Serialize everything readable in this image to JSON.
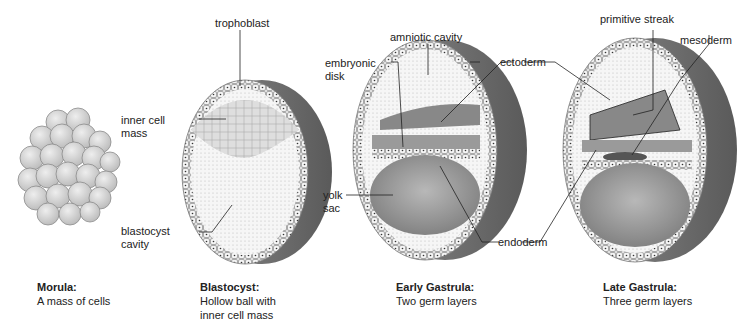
{
  "stages": [
    {
      "title": "Morula:",
      "desc": [
        "A mass of cells"
      ]
    },
    {
      "title": "Blastocyst:",
      "desc": [
        "Hollow ball with",
        "inner cell mass"
      ]
    },
    {
      "title": "Early Gastrula:",
      "desc": [
        "Two germ layers"
      ]
    },
    {
      "title": "Late Gastrula:",
      "desc": [
        "Three germ layers"
      ]
    }
  ],
  "labels": {
    "trophoblast": "trophoblast",
    "inner_cell_mass": [
      "inner cell",
      "mass"
    ],
    "blastocyst_cavity": [
      "blastocyst",
      "cavity"
    ],
    "amniotic_cavity": "amniotic cavity",
    "embryonic_disk": [
      "embryonic",
      "disk"
    ],
    "ectoderm": "ectoderm",
    "yolk_sac": [
      "yolk",
      "sac"
    ],
    "endoderm": "endoderm",
    "primitive_streak": "primitive streak",
    "mesoderm": "mesoderm"
  },
  "colors": {
    "cell_fill": "#d9d9d9",
    "cell_stroke": "#8c8c8c",
    "shell_dark": "#6e6e6e",
    "cavity_light": "#f3f3f3",
    "yolk_gray": "#9a9a9a",
    "leader_line": "#222222"
  }
}
